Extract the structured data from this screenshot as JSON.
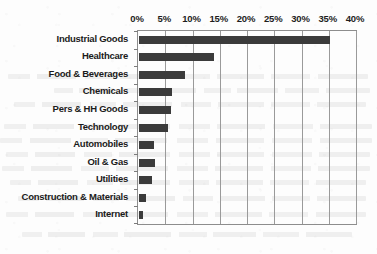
{
  "chart_data": {
    "type": "bar",
    "orientation": "horizontal",
    "title": "",
    "subtitle": "",
    "xlabel": "",
    "ylabel": "",
    "xlim": [
      0,
      40
    ],
    "ylim": null,
    "grid": true,
    "grid_axis": "x",
    "legend": false,
    "legend_position": "none",
    "value_suffix": "%",
    "axis_tick_labels": [
      "0%",
      "5%",
      "10%",
      "15%",
      "20%",
      "25%",
      "30%",
      "35%",
      "40%"
    ],
    "axis_tick_values": [
      0,
      5,
      10,
      15,
      20,
      25,
      30,
      35,
      40
    ],
    "categories": [
      "Industrial Goods",
      "Healthcare",
      "Food & Beverages",
      "Chemicals",
      "Pers & HH Goods",
      "Technology",
      "Automobiles",
      "Oil & Gas",
      "Utilities",
      "Construction & Materials",
      "Internet"
    ],
    "values": [
      35.0,
      13.7,
      8.4,
      6.1,
      5.8,
      5.4,
      2.8,
      2.9,
      2.4,
      1.2,
      0.8
    ],
    "series": [
      {
        "name": "Share",
        "color": "#3b3b3b",
        "values": [
          35.0,
          13.7,
          8.4,
          6.1,
          5.8,
          5.4,
          2.8,
          2.9,
          2.4,
          1.2,
          0.8
        ]
      }
    ]
  },
  "colors": {
    "bar": "#3b3b3b",
    "gridline": "#9a9a9a",
    "axis": "#8d8d8d",
    "text": "#1b1b1b",
    "background": "#fdfdfd"
  }
}
